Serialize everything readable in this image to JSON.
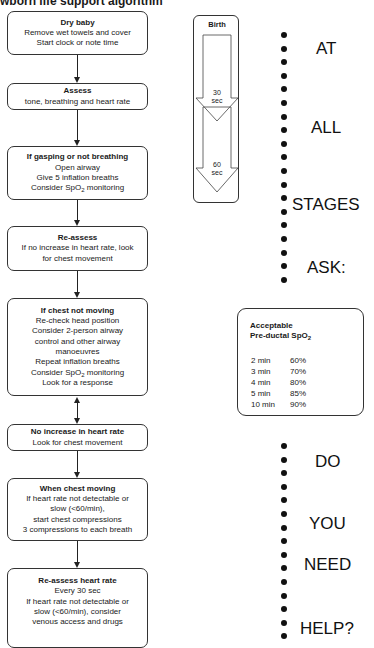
{
  "title_visible": "wborn life support algorithm",
  "flow": [
    {
      "heading": "Dry baby",
      "lines": [
        "Remove wet towels and cover",
        "Start clock or note time"
      ]
    },
    {
      "heading": "Assess",
      "lines": [
        "tone, breathing and heart rate"
      ]
    },
    {
      "heading": "If gasping or not breathing",
      "lines": [
        "Open airway",
        "Give 5 inflation breaths",
        "Consider SpO2 monitoring"
      ]
    },
    {
      "heading": "Re-assess",
      "lines": [
        "If no increase in heart rate, look",
        "for chest movement"
      ]
    },
    {
      "heading": "If chest not moving",
      "lines": [
        "Re-check head position",
        "Consider 2-person airway",
        "control and other airway",
        "manoeuvres",
        "Repeat inflation breaths",
        "Consider SpO2 monitoring",
        "Look for a response"
      ]
    },
    {
      "heading": "No increase in heart rate",
      "lines": [
        "Look for chest movement"
      ]
    },
    {
      "heading": "When chest moving",
      "lines": [
        "If heart rate not detectable or",
        "slow (<60/min),",
        "start chest compressions",
        "3 compressions to each breath"
      ]
    },
    {
      "heading": "Re-assess heart rate",
      "lines": [
        "Every 30 sec",
        "If heart rate not detectable or",
        "slow (<60/min), consider",
        "venous access and drugs"
      ]
    }
  ],
  "timeline": {
    "start": "Birth",
    "marks": [
      {
        "value": "30",
        "unit": "sec"
      },
      {
        "value": "60",
        "unit": "sec"
      }
    ]
  },
  "side_words": [
    "AT",
    "ALL",
    "STAGES",
    "ASK:",
    "DO",
    "YOU",
    "NEED",
    "HELP?"
  ],
  "spo2_table": {
    "heading_line1": "Acceptable",
    "heading_line2": "Pre-ductal SpO",
    "heading_sub": "2",
    "rows": [
      {
        "time": "2 min",
        "value": "60%"
      },
      {
        "time": "3 min",
        "value": "70%"
      },
      {
        "time": "4 min",
        "value": "80%"
      },
      {
        "time": "5 min",
        "value": "85%"
      },
      {
        "time": "10 min",
        "value": "90%"
      }
    ]
  }
}
